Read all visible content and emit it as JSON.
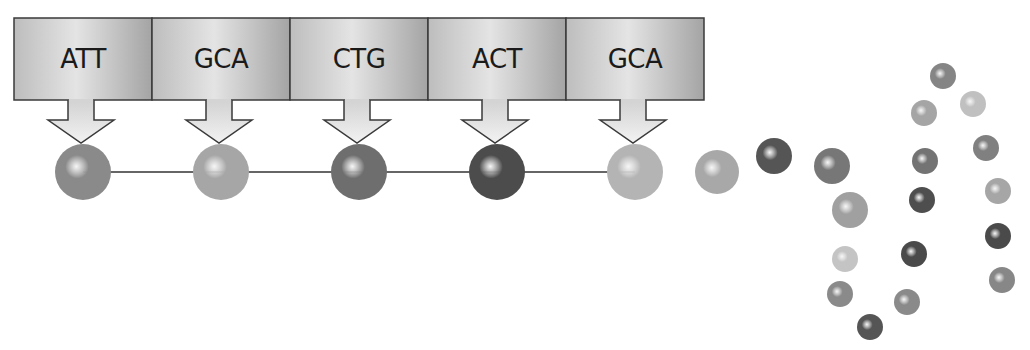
{
  "diagram": {
    "type": "codon-to-amino-acid translation",
    "codons": [
      {
        "label": "ATT",
        "x": 14,
        "width": 138,
        "sphere_shade": "#8a8a8a"
      },
      {
        "label": "GCA",
        "x": 152,
        "width": 138,
        "sphere_shade": "#a6a6a6"
      },
      {
        "label": "CTG",
        "x": 290,
        "width": 138,
        "sphere_shade": "#6e6e6e"
      },
      {
        "label": "ACT",
        "x": 428,
        "width": 138,
        "sphere_shade": "#4c4c4c"
      },
      {
        "label": "GCA",
        "x": 566,
        "width": 138,
        "sphere_shade": "#b4b4b4"
      }
    ],
    "box": {
      "top": 18,
      "height": 82,
      "fill_light": "#e6e6e6",
      "fill_dark": "#a9a9a9",
      "border": "#3a3a3a"
    },
    "chain": {
      "y": 172,
      "radius": 28,
      "line_color": "#333333"
    },
    "free_chain": [
      {
        "cx": 717,
        "cy": 172,
        "r": 22,
        "shade": "#a8a8a8"
      },
      {
        "cx": 774,
        "cy": 156,
        "r": 18,
        "shade": "#555555"
      },
      {
        "cx": 832,
        "cy": 166,
        "r": 18,
        "shade": "#777777"
      },
      {
        "cx": 850,
        "cy": 210,
        "r": 18,
        "shade": "#a0a0a0"
      },
      {
        "cx": 845,
        "cy": 259,
        "r": 13,
        "shade": "#c4c4c4"
      },
      {
        "cx": 840,
        "cy": 294,
        "r": 13,
        "shade": "#8a8a8a"
      },
      {
        "cx": 870,
        "cy": 327,
        "r": 13,
        "shade": "#555555"
      },
      {
        "cx": 907,
        "cy": 302,
        "r": 13,
        "shade": "#8a8a8a"
      },
      {
        "cx": 914,
        "cy": 254,
        "r": 13,
        "shade": "#4a4a4a"
      },
      {
        "cx": 922,
        "cy": 200,
        "r": 13,
        "shade": "#4e4e4e"
      },
      {
        "cx": 925,
        "cy": 161,
        "r": 13,
        "shade": "#737373"
      },
      {
        "cx": 924,
        "cy": 113,
        "r": 13,
        "shade": "#a5a5a5"
      },
      {
        "cx": 943,
        "cy": 76,
        "r": 13,
        "shade": "#858585"
      },
      {
        "cx": 973,
        "cy": 104,
        "r": 13,
        "shade": "#c0c0c0"
      },
      {
        "cx": 986,
        "cy": 148,
        "r": 13,
        "shade": "#808080"
      },
      {
        "cx": 998,
        "cy": 191,
        "r": 13,
        "shade": "#a6a6a6"
      },
      {
        "cx": 998,
        "cy": 236,
        "r": 13,
        "shade": "#4a4a4a"
      },
      {
        "cx": 1002,
        "cy": 280,
        "r": 13,
        "shade": "#878787"
      }
    ],
    "caption_cropped": true
  }
}
